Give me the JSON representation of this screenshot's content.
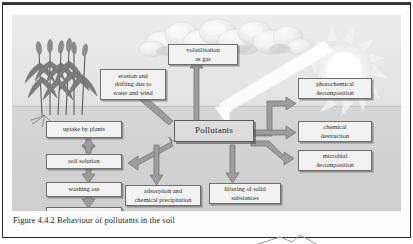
{
  "figure": {
    "caption": "Figure 4.4.2 Behaviour of pollutants in the soil",
    "center_node": "Pollutants",
    "scene": {
      "sky_label": "sky",
      "soil_label": "soil",
      "sun_label": "sun-icon",
      "clouds_label": "clouds-icon",
      "plants_label": "cereal-plants-icon",
      "sunbeam_label": "sunbeam-arrow"
    },
    "colors": {
      "sky": "#e9e9e9",
      "soil": "#d3d3d3",
      "box_fill": "#f2f2f2",
      "center_box_fill": "#dcdcdc",
      "box_border": "#6e6e6e",
      "arrow": "#9a9a9a",
      "arrow_outline": "#6f6f6f",
      "beam": "#fbfbfb",
      "text": "#2a2a2a"
    },
    "nodes": [
      {
        "id": "volatilisation",
        "label": "volatilisation\nas gas"
      },
      {
        "id": "erosion",
        "label": "erosion and\ndrifting due to\nwater and wind"
      },
      {
        "id": "photochemical",
        "label": "photochemical\ndecomposition"
      },
      {
        "id": "chemical",
        "label": "chemical\ndestruction"
      },
      {
        "id": "microbial",
        "label": "microbial\ndecomposition"
      },
      {
        "id": "uptake",
        "label": "uptake by plants"
      },
      {
        "id": "soil-solution",
        "label": "soil solution"
      },
      {
        "id": "washing-out",
        "label": "washing out"
      },
      {
        "id": "groundwater",
        "label": "groundwater"
      },
      {
        "id": "adsorption",
        "label": "adsorption and\nchemical precipitation"
      },
      {
        "id": "filtering",
        "label": "filtering of solid\nsubstances"
      }
    ],
    "flows": [
      {
        "from": "Pollutants",
        "to": "volatilisation as gas"
      },
      {
        "from": "Pollutants",
        "to": "erosion and drifting due to water and wind"
      },
      {
        "from": "Pollutants",
        "to": "photochemical decomposition"
      },
      {
        "from": "Pollutants",
        "to": "chemical destruction"
      },
      {
        "from": "Pollutants",
        "to": "microbial decomposition"
      },
      {
        "from": "Pollutants",
        "to": "soil solution"
      },
      {
        "from": "Pollutants",
        "to": "adsorption and chemical precipitation"
      },
      {
        "from": "Pollutants",
        "to": "filtering of solid substances"
      },
      {
        "from": "soil solution",
        "to": "uptake by plants"
      },
      {
        "from": "soil solution",
        "to": "washing out"
      },
      {
        "from": "washing out",
        "to": "groundwater"
      },
      {
        "from": "sunlight",
        "to": "Pollutants"
      }
    ]
  }
}
